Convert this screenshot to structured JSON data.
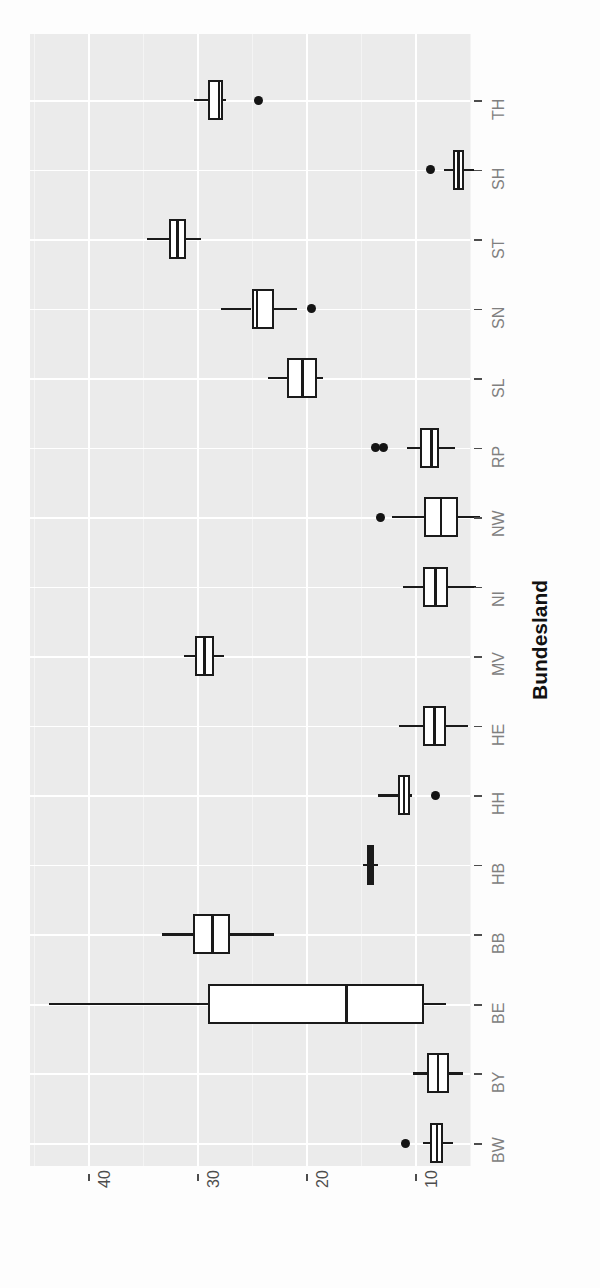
{
  "chart_data": {
    "type": "box",
    "title": "",
    "xlabel": "Bundesland",
    "ylabel": "",
    "orientation": "horizontal-rotated",
    "grid": true,
    "legend": "none",
    "value_axis": {
      "ticks": [
        40,
        30,
        20,
        10
      ],
      "tick_labels": [
        "40",
        "30",
        "20",
        "10"
      ],
      "range": [
        46,
        2
      ],
      "direction": "descending-left-to-right"
    },
    "categories": [
      "BW",
      "BY",
      "BE",
      "BB",
      "HB",
      "HH",
      "HE",
      "MV",
      "NI",
      "NW",
      "RP",
      "SL",
      "SN",
      "ST",
      "SH",
      "TH"
    ],
    "category_axis_label": "Bundesland",
    "boxes": [
      {
        "category": "BW",
        "whisker_low": 9.3,
        "q1": 8.6,
        "median": 8.0,
        "q3": 7.4,
        "whisker_high": 6.5,
        "outliers": [
          10.9
        ]
      },
      {
        "category": "BY",
        "whisker_low": 10.2,
        "q1": 8.9,
        "median": 7.9,
        "q3": 6.9,
        "whisker_high": 5.6,
        "outliers": []
      },
      {
        "category": "BE",
        "whisker_low": 43.6,
        "q1": 29.0,
        "median": 16.3,
        "q3": 9.2,
        "whisker_high": 7.2,
        "outliers": []
      },
      {
        "category": "BB",
        "whisker_low": 33.2,
        "q1": 30.4,
        "median": 28.6,
        "q3": 27.0,
        "whisker_high": 22.9,
        "outliers": []
      },
      {
        "category": "HB",
        "whisker_low": 14.8,
        "q1": 14.4,
        "median": 14.1,
        "q3": 13.8,
        "whisker_high": 13.4,
        "outliers": []
      },
      {
        "category": "HH",
        "whisker_low": 13.4,
        "q1": 11.6,
        "median": 11.0,
        "q3": 10.5,
        "whisker_high": 10.3,
        "outliers": [
          8.1
        ]
      },
      {
        "category": "HE",
        "whisker_low": 11.5,
        "q1": 9.3,
        "median": 8.2,
        "q3": 7.2,
        "whisker_high": 5.1,
        "outliers": []
      },
      {
        "category": "MV",
        "whisker_low": 31.2,
        "q1": 30.2,
        "median": 29.3,
        "q3": 28.4,
        "whisker_high": 27.5,
        "outliers": []
      },
      {
        "category": "NI",
        "whisker_low": 11.1,
        "q1": 9.3,
        "median": 8.1,
        "q3": 7.0,
        "whisker_high": 4.4,
        "outliers": []
      },
      {
        "category": "NW",
        "whisker_low": 12.1,
        "q1": 9.2,
        "median": 7.6,
        "q3": 6.1,
        "whisker_high": 4.0,
        "outliers": [
          13.2
        ]
      },
      {
        "category": "RP",
        "whisker_low": 10.7,
        "q1": 9.5,
        "median": 8.5,
        "q3": 7.8,
        "whisker_high": 6.3,
        "outliers": [
          13.6,
          12.9
        ]
      },
      {
        "category": "SL",
        "whisker_low": 23.5,
        "q1": 21.7,
        "median": 20.3,
        "q3": 19.0,
        "whisker_high": 18.4,
        "outliers": []
      },
      {
        "category": "SN",
        "whisker_low": 27.8,
        "q1": 25.0,
        "median": 24.5,
        "q3": 22.9,
        "whisker_high": 20.8,
        "outliers": [
          19.5
        ]
      },
      {
        "category": "ST",
        "whisker_low": 34.6,
        "q1": 32.6,
        "median": 31.8,
        "q3": 31.0,
        "whisker_high": 29.6,
        "outliers": []
      },
      {
        "category": "SH",
        "whisker_low": 7.3,
        "q1": 6.5,
        "median": 6.0,
        "q3": 5.5,
        "whisker_high": 4.6,
        "outliers": [
          8.6
        ]
      },
      {
        "category": "TH",
        "whisker_low": 30.3,
        "q1": 29.0,
        "median": 28.0,
        "q3": 27.6,
        "whisker_high": 27.3,
        "outliers": [
          24.4
        ]
      }
    ]
  },
  "axis": {
    "value_tick_labels": [
      "40",
      "30",
      "20",
      "10"
    ],
    "category_tick_labels": [
      "BW",
      "BY",
      "BE",
      "BB",
      "HB",
      "HH",
      "HE",
      "MV",
      "NI",
      "NW",
      "RP",
      "SL",
      "SN",
      "ST",
      "SH",
      "TH"
    ],
    "category_axis_title": "Bundesland"
  },
  "style": {
    "panel_background": "#ebebeb",
    "grid_color": "#ffffff",
    "box_stroke": "#1a1a1a",
    "box_fill": "#ffffff",
    "outlier_color": "#141414",
    "tick_label_color": "#808080",
    "axis_title_color": "#111111"
  }
}
